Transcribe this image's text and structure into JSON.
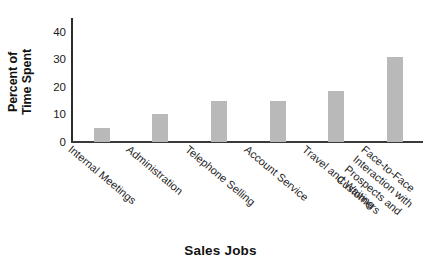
{
  "chart_data": {
    "type": "bar",
    "title": "",
    "xlabel": "Sales Jobs",
    "ylabel": "Percent of Time Spent",
    "ylim": [
      0,
      45
    ],
    "yticks": [
      0,
      10,
      20,
      30,
      40
    ],
    "ytick_labels": [
      "0",
      "10",
      "20",
      "30",
      "40"
    ],
    "grid": false,
    "legend": false,
    "bar_color": "#b9b9b9",
    "axis_color": "#2b2b2b",
    "categories": [
      "Internal Meetings",
      "Administration",
      "Telephone Selling",
      "Account Service",
      "Travel and Waiting",
      "Face-to-Face Interaction with Prospects and Customers"
    ],
    "category_lines": [
      [
        "Internal Meetings"
      ],
      [
        "Administration"
      ],
      [
        "Telephone Selling"
      ],
      [
        "Account Service"
      ],
      [
        "Travel and Waiting"
      ],
      [
        "Face-to-Face",
        "Interaction with",
        "Prospects and",
        "Customers"
      ]
    ],
    "values": [
      5,
      10,
      15,
      15,
      18.5,
      31
    ]
  },
  "axis": {
    "y_title": "Percent of Time Spent",
    "y_title_line1": "Percent of",
    "y_title_line2": "Time Spent",
    "x_title": "Sales Jobs"
  }
}
